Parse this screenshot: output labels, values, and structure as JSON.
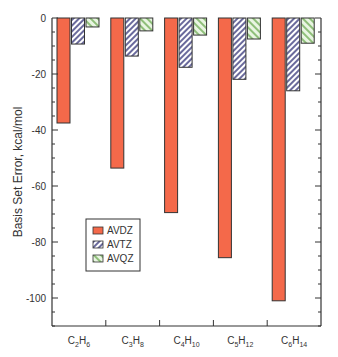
{
  "chart_data": {
    "type": "bar",
    "title": "",
    "xlabel": "",
    "ylabel": "Basis Set Error, kcal/mol",
    "ylim": [
      -110,
      0
    ],
    "yticks": [
      0,
      -20,
      -40,
      -60,
      -80,
      -100
    ],
    "ytick_labels": [
      "0",
      "-20",
      "-40",
      "-60",
      "-80",
      "-100"
    ],
    "grid": false,
    "legend_position": "lower-left inside",
    "categories": [
      {
        "base": "C",
        "n1": "2",
        "h": "H",
        "n2": "6"
      },
      {
        "base": "C",
        "n1": "3",
        "h": "H",
        "n2": "8"
      },
      {
        "base": "C",
        "n1": "4",
        "h": "H",
        "n2": "10"
      },
      {
        "base": "C",
        "n1": "5",
        "h": "H",
        "n2": "12"
      },
      {
        "base": "C",
        "n1": "6",
        "h": "H",
        "n2": "14"
      }
    ],
    "category_names": [
      "C2H6",
      "C3H8",
      "C4H10",
      "C5H12",
      "C6H14"
    ],
    "series": [
      {
        "name": "AVDZ",
        "color": "#f4694a",
        "pattern": "solid",
        "values": [
          -37.5,
          -53.6,
          -69.5,
          -85.6,
          -101.0
        ]
      },
      {
        "name": "AVTZ",
        "color": "#b8b8e0",
        "pattern": "hatch-dense",
        "values": [
          -9.3,
          -13.6,
          -17.6,
          -21.9,
          -26.0
        ]
      },
      {
        "name": "AVQZ",
        "color": "#b9e0a8",
        "pattern": "hatch-sparse",
        "values": [
          -3.2,
          -4.6,
          -6.1,
          -7.5,
          -9.0
        ]
      }
    ]
  }
}
